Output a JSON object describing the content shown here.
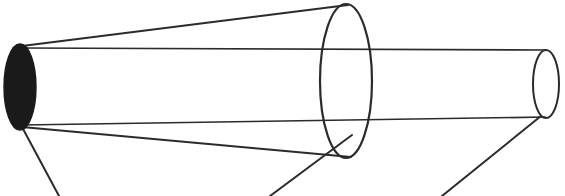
{
  "figure": {
    "background_color": "#ffffff",
    "stroke_color": "#2b2b2b",
    "fill_color": "#1a1a1a",
    "canvas": {
      "width": 565,
      "height": 196
    }
  },
  "chart_data": {
    "type": "diagram",
    "xlabel": "",
    "ylabel": "",
    "xlim": [
      0,
      565
    ],
    "ylim": [
      0,
      196
    ],
    "grid": false,
    "legend": "none",
    "annotations": [],
    "shapes": [
      {
        "name": "source-aperture-ellipse",
        "kind": "ellipse-filled",
        "cx": 20,
        "cy": 87,
        "rx": 16,
        "ry": 43,
        "fill": "#1a1a1a",
        "stroke": "#1a1a1a",
        "stroke_width": 1.4
      },
      {
        "name": "mid-cone-mouth-ellipse",
        "kind": "ellipse-outline",
        "cx": 346,
        "cy": 81,
        "rx": 26,
        "ry": 77,
        "stroke": "#2b2b2b",
        "stroke_width": 2.2
      },
      {
        "name": "far-cylinder-end-ellipse",
        "kind": "ellipse-outline",
        "cx": 546,
        "cy": 84,
        "rx": 13,
        "ry": 34,
        "stroke": "#2b2b2b",
        "stroke_width": 2.0
      }
    ],
    "lines": [
      {
        "name": "cone-upper-edge",
        "x1": 22,
        "y1": 46,
        "x2": 348,
        "y2": 5,
        "stroke_width": 2.0
      },
      {
        "name": "cone-lower-edge",
        "x1": 22,
        "y1": 127,
        "x2": 351,
        "y2": 157,
        "stroke_width": 2.0
      },
      {
        "name": "cylinder-top-edge",
        "x1": 21,
        "y1": 48,
        "x2": 546,
        "y2": 50,
        "stroke_width": 1.7
      },
      {
        "name": "cylinder-bottom-edge",
        "x1": 22,
        "y1": 125,
        "x2": 545,
        "y2": 117,
        "stroke_width": 1.7
      },
      {
        "name": "leader-line-source",
        "x1": 22,
        "y1": 127,
        "x2": 59,
        "y2": 196,
        "stroke_width": 2.0
      },
      {
        "name": "leader-line-mid-cone",
        "x1": 352,
        "y1": 135,
        "x2": 270,
        "y2": 196,
        "stroke_width": 2.0
      },
      {
        "name": "leader-line-far-end",
        "x1": 541,
        "y1": 116,
        "x2": 442,
        "y2": 196,
        "stroke_width": 2.0
      }
    ]
  }
}
